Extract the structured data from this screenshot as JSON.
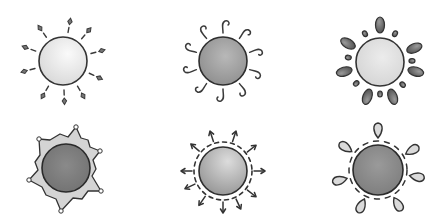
{
  "image": {
    "description": "Six hand-drawn sun illustrations arranged in a 2x3 grid",
    "background": "#ffffff"
  },
  "suns": [
    {
      "id": "sun-diamond-rays",
      "ray_style": "diamond-tipped dashes",
      "body_shade": "light",
      "body_color": "#e6e6e6",
      "cx": 63,
      "cy": 61,
      "r": 24,
      "ray_count": 12
    },
    {
      "id": "sun-curly-rays",
      "ray_style": "curly hooks",
      "body_shade": "dark",
      "body_color": "#9a9a9a",
      "cx": 223,
      "cy": 61,
      "r": 24,
      "ray_count": 10
    },
    {
      "id": "sun-oval-petals",
      "ray_style": "alternating large and small ovals",
      "body_shade": "light",
      "body_color": "#dcdcdc",
      "cx": 380,
      "cy": 61,
      "r": 24,
      "ray_count": 14
    },
    {
      "id": "sun-star-frame",
      "ray_style": "six-pointed star frame with dot tips",
      "body_shade": "dark",
      "body_color": "#7c7c7c",
      "cx": 63,
      "cy": 172,
      "r": 24,
      "ray_count": 6
    },
    {
      "id": "sun-arrow-rays",
      "ray_style": "dashed ring with arrows",
      "body_shade": "medium",
      "body_color": "#b0b0b0",
      "cx": 223,
      "cy": 172,
      "r": 24,
      "ray_count": 10
    },
    {
      "id": "sun-teardrop-rays",
      "ray_style": "teardrop petals with dashed ring",
      "body_shade": "dark",
      "body_color": "#8a8a8a",
      "cx": 380,
      "cy": 172,
      "r": 24,
      "ray_count": 6
    }
  ],
  "colors": {
    "stroke": "#3a3a3a",
    "petal_fill": "#d8d8d8",
    "oval_fill": "#6a6a6a",
    "star_fill": "#d4d4d4"
  }
}
